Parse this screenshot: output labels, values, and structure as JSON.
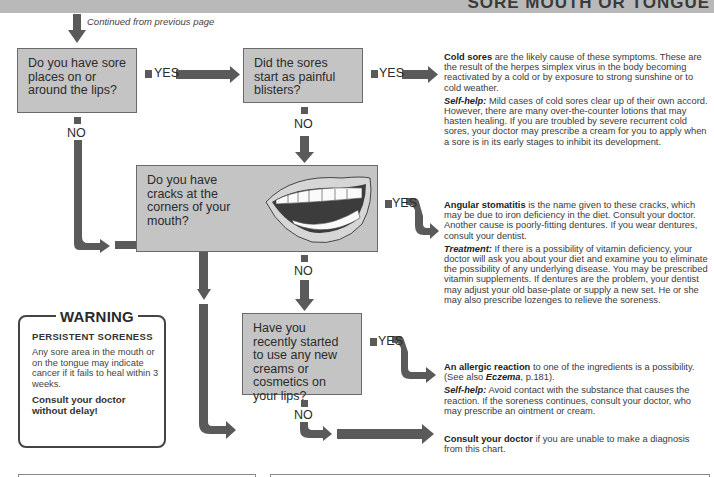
{
  "header": {
    "title": "SORE MOUTH OR TONGUE"
  },
  "continued_note": "Continued from previous page",
  "questions": [
    {
      "id": "q1",
      "text": "Do you have sore places on or around the lips?",
      "yes_label": "YES",
      "no_label": "NO"
    },
    {
      "id": "q2",
      "text": "Did the sores start as painful blisters?",
      "yes_label": "YES",
      "no_label": "NO"
    },
    {
      "id": "q3",
      "text": "Do you have cracks at the corners of your mouth?",
      "yes_label": "YES",
      "no_label": "NO",
      "illustration": "open-mouth-illustration"
    },
    {
      "id": "q4",
      "text": "Have you recently started to use any new creams or cosmetics on your lips?",
      "yes_label": "YES",
      "no_label": "NO"
    }
  ],
  "outcomes": [
    {
      "id": "cold-sores",
      "heading": "Cold sores",
      "text": " are the likely cause of these symptoms. These are the result of the herpes simplex virus in the body becoming reactivated by a cold or by exposure to strong sunshine or to cold weather.",
      "advice_label": "Self-help:",
      "advice": " Mild cases of cold sores clear up of their own accord. However, there are many over-the-counter lotions that may hasten healing. If you are troubled by severe recurrent cold sores, your doctor may prescribe a cream for you to apply when a sore is in its early stages to inhibit its development."
    },
    {
      "id": "angular-stomatitis",
      "heading": "Angular stomatitis",
      "text": " is the name given to these cracks, which may be due to iron deficiency in the diet. Consult your doctor. Another cause is poorly-fitting dentures. If you wear dentures, consult your dentist.",
      "advice_label": "Treatment:",
      "advice": " If there is a possibility of vitamin deficiency, your doctor will ask you about your diet and examine you to eliminate the possibility of any underlying disease. You may be prescribed vitamin supplements. If dentures are the problem, your dentist may adjust your old base-plate or supply a new set. He or she may also prescribe lozenges to relieve the soreness."
    },
    {
      "id": "allergic-reaction",
      "heading": "An allergic reaction",
      "text": " to one of the ingredients is a possibility. (See also ",
      "ref": "Eczema",
      "ref_tail": ", p.181).",
      "advice_label": "Self-help:",
      "advice": " Avoid contact with the substance that causes the reaction. If the soreness continues, consult your doctor, who may prescribe an ointment or cream."
    },
    {
      "id": "consult-doctor",
      "heading": "Consult your doctor",
      "text": " if you are unable to make a diagnosis from this chart."
    }
  ],
  "warning": {
    "title": "WARNING",
    "subtitle": "PERSISTENT SORENESS",
    "body": "Any sore area in the mouth or on the tongue may indicate cancer if it fails to heal within 3 weeks.",
    "cta": "Consult your doctor without delay!"
  },
  "colors": {
    "question_box": "#c4c4c4",
    "arrow": "#5a5a5a",
    "header_band": "#b9b9b9"
  }
}
